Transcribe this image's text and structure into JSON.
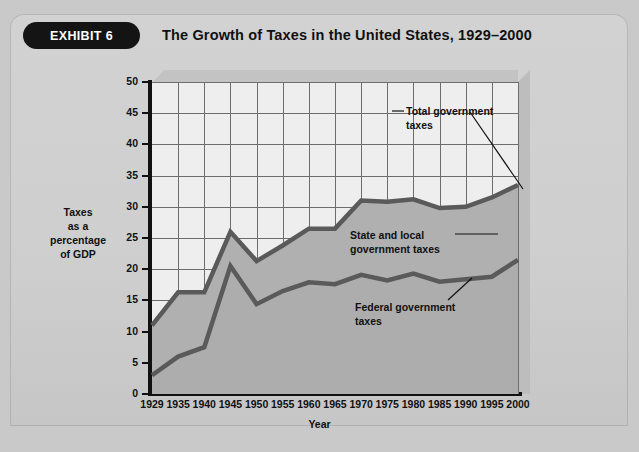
{
  "exhibit": {
    "badge_label": "EXHIBIT 6",
    "title": "The Growth of Taxes in the United States, 1929–2000"
  },
  "chart_data": {
    "type": "area",
    "title": "The Growth of Taxes in the United States, 1929–2000",
    "xlabel": "Year",
    "ylabel": "Taxes as a percentage of GDP",
    "ylabel_lines": [
      "Taxes",
      "as a",
      "percentage",
      "of GDP"
    ],
    "categories": [
      "1929",
      "1935",
      "1940",
      "1945",
      "1950",
      "1955",
      "1960",
      "1965",
      "1970",
      "1975",
      "1980",
      "1985",
      "1990",
      "1995",
      "2000"
    ],
    "x": [
      1929,
      1935,
      1940,
      1945,
      1950,
      1955,
      1960,
      1965,
      1970,
      1975,
      1980,
      1985,
      1990,
      1995,
      2000
    ],
    "series": [
      {
        "name": "Total government taxes",
        "values": [
          11.0,
          16.3,
          16.3,
          26.0,
          21.3,
          23.8,
          26.5,
          26.5,
          31.0,
          30.8,
          31.2,
          29.8,
          30.0,
          31.5,
          33.5
        ]
      },
      {
        "name": "Federal government taxes",
        "values": [
          3.0,
          6.0,
          7.5,
          20.5,
          14.4,
          16.5,
          17.9,
          17.6,
          19.1,
          18.2,
          19.3,
          18.0,
          18.4,
          18.8,
          21.5
        ]
      }
    ],
    "band_label": "State and local government taxes",
    "ylim": [
      0,
      50
    ],
    "ytick_values": [
      0,
      5,
      10,
      15,
      20,
      25,
      30,
      35,
      40,
      45,
      50
    ],
    "ytick_labels": [
      "0",
      "5",
      "10",
      "15",
      "20",
      "25",
      "30",
      "35",
      "40",
      "45",
      "50"
    ],
    "grid": true,
    "legend": "annotations-inline",
    "annotations": [
      {
        "name": "total-government-taxes",
        "text": "Total government\ntaxes"
      },
      {
        "name": "state-and-local-government-taxes",
        "text": "State and local\ngovernment taxes"
      },
      {
        "name": "federal-government-taxes",
        "text": "Federal government\ntaxes"
      }
    ],
    "colors": {
      "line": "#5a5a5a",
      "band_upper_fill": "#b0b0b0",
      "band_lower_fill": "#adadad",
      "plot_background": "#eeeeee",
      "panel_background": "#cfcfcf",
      "badge_background": "#141414",
      "grid": "#6d6d6d"
    }
  }
}
